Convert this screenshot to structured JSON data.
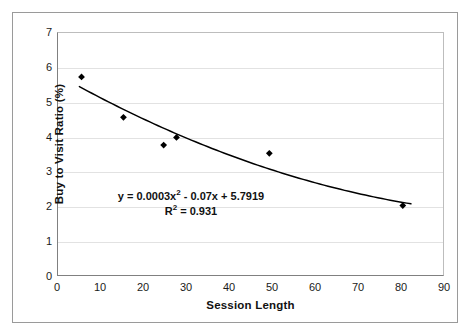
{
  "chart_data": {
    "type": "scatter",
    "title": "",
    "xlabel": "Session Length",
    "ylabel": "Buy to Visit Ratio (%)",
    "xlim": [
      0,
      90
    ],
    "ylim": [
      0,
      7
    ],
    "xticks": [
      0,
      10,
      20,
      30,
      40,
      50,
      60,
      70,
      80,
      90
    ],
    "yticks": [
      0,
      1,
      2,
      3,
      4,
      5,
      6,
      7
    ],
    "xtick_labels": [
      "0",
      "10",
      "20",
      "30",
      "40",
      "50",
      "60",
      "70",
      "80",
      "90"
    ],
    "ytick_labels": [
      "0",
      "1",
      "2",
      "3",
      "4",
      "5",
      "6",
      "7"
    ],
    "grid": "horizontal",
    "legend": "none",
    "series": [
      {
        "name": "Buy to Visit Ratio",
        "marker": "diamond",
        "color": "#000000",
        "points": [
          {
            "x": 5.5,
            "y": 5.73
          },
          {
            "x": 15.3,
            "y": 4.56
          },
          {
            "x": 24.7,
            "y": 3.76
          },
          {
            "x": 27.7,
            "y": 3.98
          },
          {
            "x": 49.4,
            "y": 3.52
          },
          {
            "x": 80.6,
            "y": 2.01
          }
        ]
      }
    ],
    "trendline": {
      "type": "polynomial",
      "order": 2,
      "coefficients": {
        "a": 0.0003,
        "b": -0.07,
        "c": 5.7919
      },
      "x_start": 5,
      "x_end": 82.5,
      "color": "#000000",
      "r_squared": 0.931
    },
    "annotations": {
      "equation_prefix": "y = 0.0003x",
      "equation_sup": "2",
      "equation_suffix": " - 0.07x + 5.7919",
      "r2_prefix": "R",
      "r2_sup": "2",
      "r2_suffix": " = 0.931"
    }
  }
}
